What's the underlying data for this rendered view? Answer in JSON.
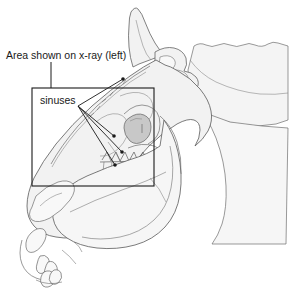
{
  "figure": {
    "background_color": "#ffffff",
    "outline_color": "#4a4a4a",
    "bone_fill": "#f2f2f2",
    "shade_fill": "#d0d0d0",
    "eye_socket_fill": "#c8c8c8",
    "mane_fill": "#f4f4f4",
    "box_stroke": "#1a1a1a",
    "leader_stroke": "#1a1a1a",
    "text_color": "#1a1a1a"
  },
  "labels": {
    "callout": {
      "text": "Area shown on x-ray (left)",
      "x": 6,
      "y": 59
    },
    "sinuses": {
      "text": "sinuses",
      "x": 40,
      "y": 104
    }
  },
  "region_box": {
    "name": "x-ray-region",
    "x": 32,
    "y": 88,
    "width": 122,
    "height": 98
  },
  "callout_leader": {
    "from_x": 51,
    "from_y": 62,
    "to_x": 51,
    "to_y": 88
  },
  "sinus_pointers": [
    {
      "x1": 78,
      "y1": 106,
      "x2": 114,
      "y2": 136
    },
    {
      "x1": 78,
      "y1": 106,
      "x2": 122,
      "y2": 152
    },
    {
      "x1": 78,
      "y1": 106,
      "x2": 115,
      "y2": 165
    },
    {
      "x1": 78,
      "y1": 106,
      "x2": 123,
      "y2": 79
    }
  ],
  "sinus_markers": [
    {
      "cx": 114,
      "cy": 136,
      "r": 1.8
    },
    {
      "cx": 122,
      "cy": 152,
      "r": 1.8
    },
    {
      "cx": 115,
      "cy": 165,
      "r": 1.8
    },
    {
      "cx": 123,
      "cy": 79,
      "r": 1.8
    }
  ],
  "anatomy_parts": [
    "ear",
    "skull-outline",
    "mane",
    "nasal-bone",
    "eye-socket",
    "upper-teeth",
    "lower-teeth",
    "mandible",
    "incisors",
    "muzzle",
    "occipital-crest"
  ]
}
